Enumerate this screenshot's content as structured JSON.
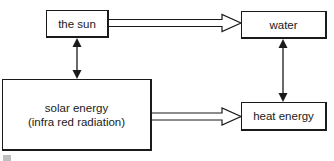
{
  "diagram": {
    "nodes": [
      {
        "id": "sun",
        "label": "the sun"
      },
      {
        "id": "water",
        "label": "water"
      },
      {
        "id": "solar",
        "label_lines": [
          "solar energy",
          "(infra red radiation)"
        ]
      },
      {
        "id": "heat",
        "label": "heat energy"
      }
    ],
    "edges": [
      {
        "from": "sun",
        "to": "water",
        "style": "hollow-arrow"
      },
      {
        "from": "solar",
        "to": "heat",
        "style": "hollow-arrow"
      },
      {
        "from": "sun",
        "to": "solar",
        "style": "double-headed-arrow"
      },
      {
        "from": "water",
        "to": "heat",
        "style": "double-headed-arrow"
      }
    ],
    "colors": {
      "stroke": "#1a1a1a",
      "background": "#ffffff"
    }
  }
}
